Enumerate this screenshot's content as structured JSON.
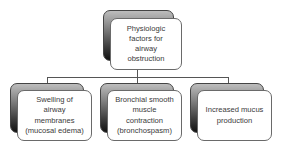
{
  "diagram": {
    "type": "hierarchy",
    "root": {
      "label": "Physiologic\nfactors for\nairway\nobstruction"
    },
    "children": [
      {
        "label": "Swelling of\nairway\nmembranes\n(mucosal edema)"
      },
      {
        "label": "Bronchial smooth\nmuscle\ncontraction\n(bronchospasm)"
      },
      {
        "label": "Increased mucus\nproduction"
      }
    ],
    "colors": {
      "line": "#555555",
      "box_border": "#6a6a6a",
      "text": "#3a3a3a",
      "shadow_top": "#bdbdbd",
      "shadow_bottom": "#111111"
    }
  }
}
